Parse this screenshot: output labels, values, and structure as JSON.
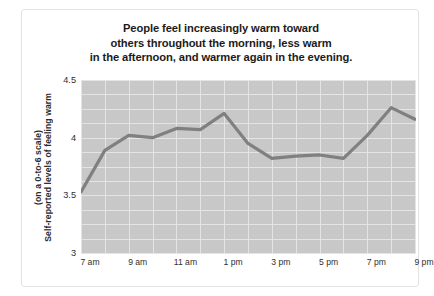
{
  "figure": {
    "title_lines": [
      "People feel increasingly warm toward",
      "others throughout the morning, less warm",
      "in the afternoon, and warmer again in the evening."
    ],
    "ylabel_line1": "Self-reported levels of feeling warm",
    "ylabel_line2": "(on a 0-to-6 scale)",
    "plot_bg_color": "#c8c8c8",
    "grid_color": "#e4e4e4",
    "line_color": "#808080",
    "frame_color": "#e2e2e2"
  },
  "chart_data": {
    "type": "line",
    "title": "People feel increasingly warm toward others throughout the morning, less warm in the afternoon, and warmer again in the evening.",
    "xlabel": "",
    "ylabel": "Self-reported levels of feeling warm (on a 0-to-6 scale)",
    "x": [
      "7 am",
      "8 am",
      "9 am",
      "10 am",
      "11 am",
      "12 pm",
      "1 pm",
      "2 pm",
      "3 pm",
      "4 pm",
      "5 pm",
      "6 pm",
      "7 pm",
      "8 pm",
      "9 pm"
    ],
    "tick_labels": [
      "7 am",
      "9 am",
      "11 am",
      "1 pm",
      "3 pm",
      "5 pm",
      "7 pm",
      "9 pm"
    ],
    "tick_indices": [
      0,
      2,
      4,
      6,
      8,
      10,
      12,
      14
    ],
    "values": [
      3.53,
      3.89,
      4.02,
      4.0,
      4.08,
      4.07,
      4.21,
      3.95,
      3.82,
      3.84,
      3.85,
      3.82,
      4.02,
      4.26,
      4.16
    ],
    "ylim": [
      3,
      4.5
    ],
    "yticks": [
      3,
      3.5,
      4,
      4.5
    ],
    "ytick_labels": [
      "3",
      "3.5",
      "4",
      "4.5"
    ],
    "grid": true,
    "legend": "none",
    "series": [
      {
        "name": "Self-reported feeling warm",
        "values": [
          3.53,
          3.89,
          4.02,
          4.0,
          4.08,
          4.07,
          4.21,
          3.95,
          3.82,
          3.84,
          3.85,
          3.82,
          4.02,
          4.26,
          4.16
        ]
      }
    ]
  }
}
